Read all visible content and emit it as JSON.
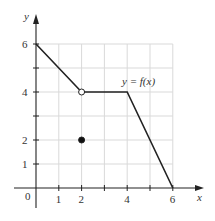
{
  "chart_data": {
    "type": "line",
    "title": "",
    "xlabel": "x",
    "ylabel": "y",
    "xlim": [
      0,
      6
    ],
    "ylim": [
      0,
      6
    ],
    "grid": true,
    "x_ticks": [
      "1",
      "2",
      "4",
      "6"
    ],
    "x_tick_values": [
      1,
      2,
      3,
      4,
      5,
      6
    ],
    "y_ticks": [
      "1",
      "2",
      "4",
      "6"
    ],
    "y_tick_values": [
      1,
      2,
      3,
      4,
      5,
      6
    ],
    "origin_label": "0",
    "series": [
      {
        "name": "y = f(x)",
        "x": [
          0,
          2,
          4,
          6
        ],
        "y": [
          6,
          4,
          4,
          0
        ]
      }
    ],
    "points": [
      {
        "x": 2,
        "y": 4,
        "style": "open",
        "note": "hole"
      },
      {
        "x": 2,
        "y": 2,
        "style": "filled",
        "note": "f(2)"
      }
    ],
    "annotations": [
      {
        "text": "y = f(x)",
        "x": 5,
        "y": 4.6
      }
    ]
  }
}
